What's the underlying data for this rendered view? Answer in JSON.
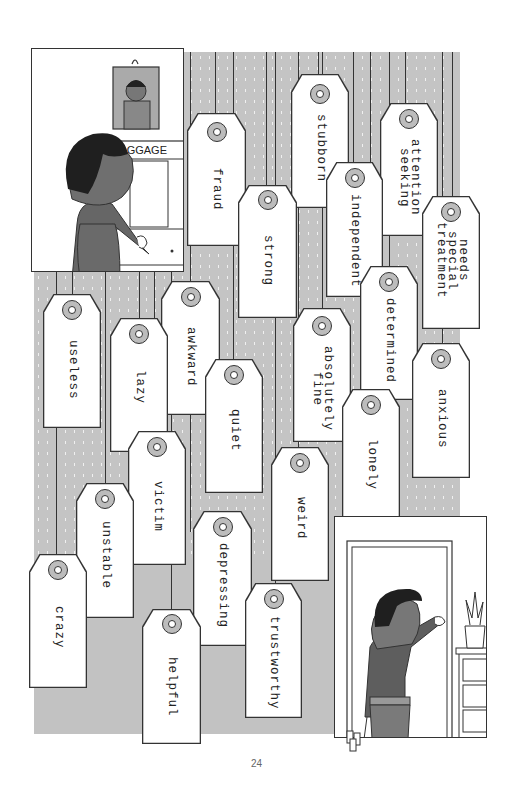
{
  "page": {
    "page_number": "24",
    "background_color": "#c4c4c4"
  },
  "panel_top_left": {
    "sign_text": "BAGGAGE",
    "description": "woman opening baggage cupboard, framed portrait on wall"
  },
  "panel_bottom_right": {
    "description": "woman walking out through doorway carrying small tags"
  },
  "tags": [
    {
      "id": "fraud",
      "text": "fraud"
    },
    {
      "id": "strong",
      "text": "strong"
    },
    {
      "id": "stubborn",
      "text": "stubborn"
    },
    {
      "id": "independent",
      "text": "independent"
    },
    {
      "id": "attention-seeking",
      "text": "attention\nseeking"
    },
    {
      "id": "needs-special-treatment",
      "text": "needs\nspecial\ntreatment"
    },
    {
      "id": "determined",
      "text": "determined"
    },
    {
      "id": "anxious",
      "text": "anxious"
    },
    {
      "id": "absolutely-fine",
      "text": "absolutely\nfine"
    },
    {
      "id": "lonely",
      "text": "lonely"
    },
    {
      "id": "useless",
      "text": "useless"
    },
    {
      "id": "lazy",
      "text": "lazy"
    },
    {
      "id": "awkward",
      "text": "awkward"
    },
    {
      "id": "quiet",
      "text": "quiet"
    },
    {
      "id": "victim",
      "text": "victim"
    },
    {
      "id": "unstable",
      "text": "unstable"
    },
    {
      "id": "crazy",
      "text": "crazy"
    },
    {
      "id": "helpful",
      "text": "helpful"
    },
    {
      "id": "depressing",
      "text": "depressing"
    },
    {
      "id": "weird",
      "text": "weird"
    },
    {
      "id": "trustworthy",
      "text": "trustworthy"
    }
  ]
}
